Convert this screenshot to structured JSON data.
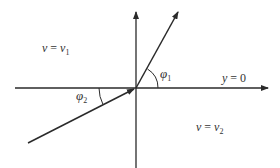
{
  "diagram": {
    "type": "refraction-angle-diagram",
    "colors": {
      "background": "#ffffff",
      "stroke": "#2a2a2a",
      "text": "#333333"
    },
    "origin": {
      "x": 136,
      "y": 88
    },
    "axes": {
      "horizontal": {
        "x1": 15,
        "x2": 268,
        "y": 88,
        "arrow": "right"
      },
      "vertical": {
        "x": 136,
        "y1": 168,
        "y2": 12,
        "arrow": "up"
      }
    },
    "rays": {
      "outgoing": {
        "name": "upper-ray",
        "x1": 136,
        "y1": 88,
        "x2": 178,
        "y2": 12,
        "arrow_at": "end"
      },
      "incoming": {
        "name": "lower-ray",
        "x1": 28,
        "y1": 143,
        "x2": 136,
        "y2": 88,
        "arrow_at": "end"
      }
    },
    "labels": {
      "region_upper": {
        "var": "v",
        "eq": " = ",
        "rhs": "v",
        "sub": "1"
      },
      "region_lower": {
        "var": "v",
        "eq": " = ",
        "rhs": "v",
        "sub": "2"
      },
      "interface": {
        "var": "y",
        "eq": " = ",
        "rhs": "0"
      },
      "angle_1": {
        "symbol": "φ",
        "sub": "1"
      },
      "angle_2": {
        "symbol": "φ",
        "sub": "2"
      }
    }
  }
}
